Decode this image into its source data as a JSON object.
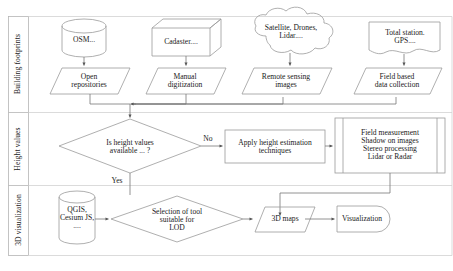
{
  "diagram": {
    "type": "flowchart",
    "stroke_color": "#8a8a8a",
    "text_color": "#1a1a1a",
    "background": "#ffffff"
  },
  "swimlanes": [
    {
      "id": "lane-building-footprints",
      "label": "Building footprints"
    },
    {
      "id": "lane-height-values",
      "label": "Height values"
    },
    {
      "id": "lane-3d-visualization",
      "label": "3D visualization"
    }
  ],
  "nodes": {
    "osm": {
      "label": "OSM...",
      "shape": "cylinder"
    },
    "cadaster": {
      "label": "Cadaster....",
      "shape": "cube"
    },
    "satellite": {
      "label": "Satellite, Drones,\nLidar....",
      "shape": "cloud"
    },
    "total_station": {
      "label": "Total station.\nGPS....",
      "shape": "document"
    },
    "open_repositories": {
      "label": "Open\nrepositories",
      "shape": "parallelogram"
    },
    "manual_digitization": {
      "label": "Manual\ndigitization",
      "shape": "parallelogram"
    },
    "remote_sensing": {
      "label": "Remote sensing\nimages",
      "shape": "parallelogram"
    },
    "field_based": {
      "label": "Field based\ndata collection",
      "shape": "parallelogram"
    },
    "height_decision": {
      "label": "Is height values\navailable ... ?",
      "shape": "diamond"
    },
    "apply_height": {
      "label": "Apply height estimation\ntechniques",
      "shape": "rectangle"
    },
    "methods": {
      "label": "Field measurement\nShadow on images\nStereo processing\nLidar or Radar",
      "shape": "predefined-process"
    },
    "tools": {
      "label": "QGIS,\nCesium JS,\n....",
      "shape": "cylinder"
    },
    "lod_decision": {
      "label": "Selection of tool\nsuitable for\nLOD",
      "shape": "diamond"
    },
    "maps_3d": {
      "label": "3D maps",
      "shape": "parallelogram"
    },
    "visualization": {
      "label": "Visualization",
      "shape": "terminator-right"
    }
  },
  "edge_labels": {
    "no": "No",
    "yes": "Yes"
  }
}
